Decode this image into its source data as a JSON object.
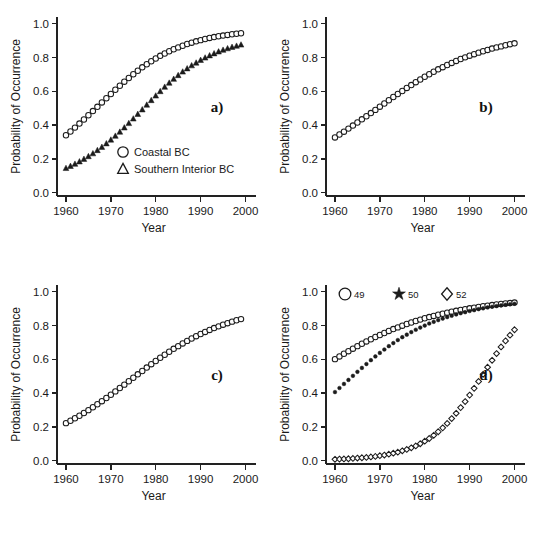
{
  "figure": {
    "name": "probability-of-occurrence-four-panel-figure",
    "background_color": "#ffffff",
    "marker_color": "#1b1b1b",
    "axis_color": "#222222"
  },
  "chart_data": [
    {
      "id": "a",
      "type": "scatter",
      "panel_label": "a)",
      "title": "",
      "xlabel": "Year",
      "ylabel": "Probability of Occurrence",
      "xlim": [
        1958,
        2001
      ],
      "ylim": [
        -0.02,
        1.04
      ],
      "xticks": [
        1960,
        1970,
        1980,
        1990,
        2000
      ],
      "xticklabels": [
        "1960",
        "1970",
        "1980",
        "1990",
        "2000"
      ],
      "yticks": [
        0.0,
        0.2,
        0.4,
        0.6,
        0.8,
        1.0
      ],
      "yticklabels": [
        "0.0",
        "0.2",
        "0.4",
        "0.6",
        "0.8",
        "1.0"
      ],
      "grid": false,
      "legend_position": "lower-center",
      "x": [
        1960,
        1961,
        1962,
        1963,
        1964,
        1965,
        1966,
        1967,
        1968,
        1969,
        1970,
        1971,
        1972,
        1973,
        1974,
        1975,
        1976,
        1977,
        1978,
        1979,
        1980,
        1981,
        1982,
        1983,
        1984,
        1985,
        1986,
        1987,
        1988,
        1989,
        1990,
        1991,
        1992,
        1993,
        1994,
        1995,
        1996,
        1997,
        1998,
        1999
      ],
      "series": [
        {
          "name": "Coastal BC",
          "marker": "circle-open",
          "values": [
            0.34,
            0.362,
            0.385,
            0.409,
            0.433,
            0.458,
            0.483,
            0.508,
            0.534,
            0.559,
            0.584,
            0.609,
            0.633,
            0.657,
            0.679,
            0.701,
            0.722,
            0.742,
            0.76,
            0.778,
            0.794,
            0.81,
            0.824,
            0.837,
            0.849,
            0.86,
            0.87,
            0.88,
            0.888,
            0.896,
            0.903,
            0.91,
            0.916,
            0.921,
            0.926,
            0.93,
            0.934,
            0.938,
            0.941,
            0.944
          ]
        },
        {
          "name": "Southern Interior BC",
          "marker": "triangle-filled",
          "values": [
            0.145,
            0.157,
            0.17,
            0.184,
            0.199,
            0.215,
            0.232,
            0.251,
            0.27,
            0.291,
            0.313,
            0.336,
            0.36,
            0.385,
            0.411,
            0.438,
            0.465,
            0.492,
            0.52,
            0.547,
            0.574,
            0.6,
            0.626,
            0.65,
            0.673,
            0.695,
            0.716,
            0.735,
            0.753,
            0.769,
            0.785,
            0.799,
            0.812,
            0.824,
            0.835,
            0.845,
            0.854,
            0.862,
            0.869,
            0.876
          ]
        }
      ]
    },
    {
      "id": "b",
      "type": "scatter",
      "panel_label": "b)",
      "title": "",
      "xlabel": "Year",
      "ylabel": "Probability of Occurrence",
      "xlim": [
        1958,
        2001
      ],
      "ylim": [
        -0.02,
        1.04
      ],
      "xticks": [
        1960,
        1970,
        1980,
        1990,
        2000
      ],
      "xticklabels": [
        "1960",
        "1970",
        "1980",
        "1990",
        "2000"
      ],
      "yticks": [
        0.0,
        0.2,
        0.4,
        0.6,
        0.8,
        1.0
      ],
      "yticklabels": [
        "0.0",
        "0.2",
        "0.4",
        "0.6",
        "0.8",
        "1.0"
      ],
      "grid": false,
      "legend_position": "none",
      "x": [
        1960,
        1961,
        1962,
        1963,
        1964,
        1965,
        1966,
        1967,
        1968,
        1969,
        1970,
        1971,
        1972,
        1973,
        1974,
        1975,
        1976,
        1977,
        1978,
        1979,
        1980,
        1981,
        1982,
        1983,
        1984,
        1985,
        1986,
        1987,
        1988,
        1989,
        1990,
        1991,
        1992,
        1993,
        1994,
        1995,
        1996,
        1997,
        1998,
        1999,
        2000
      ],
      "series": [
        {
          "name": "series-b",
          "marker": "circle-open",
          "values": [
            0.327,
            0.344,
            0.361,
            0.379,
            0.397,
            0.415,
            0.434,
            0.452,
            0.471,
            0.49,
            0.509,
            0.528,
            0.547,
            0.566,
            0.584,
            0.602,
            0.62,
            0.637,
            0.654,
            0.67,
            0.686,
            0.701,
            0.716,
            0.73,
            0.743,
            0.756,
            0.768,
            0.78,
            0.791,
            0.801,
            0.811,
            0.82,
            0.829,
            0.837,
            0.845,
            0.853,
            0.86,
            0.866,
            0.873,
            0.879,
            0.884
          ]
        }
      ]
    },
    {
      "id": "c",
      "type": "scatter",
      "panel_label": "c)",
      "title": "",
      "xlabel": "Year",
      "ylabel": "Probability of Occurrence",
      "xlim": [
        1958,
        2001
      ],
      "ylim": [
        -0.02,
        1.04
      ],
      "xticks": [
        1960,
        1970,
        1980,
        1990,
        2000
      ],
      "xticklabels": [
        "1960",
        "1970",
        "1980",
        "1990",
        "2000"
      ],
      "yticks": [
        0.0,
        0.2,
        0.4,
        0.6,
        0.8,
        1.0
      ],
      "yticklabels": [
        "0.0",
        "0.2",
        "0.4",
        "0.6",
        "0.8",
        "1.0"
      ],
      "grid": false,
      "legend_position": "none",
      "x": [
        1960,
        1961,
        1962,
        1963,
        1964,
        1965,
        1966,
        1967,
        1968,
        1969,
        1970,
        1971,
        1972,
        1973,
        1974,
        1975,
        1976,
        1977,
        1978,
        1979,
        1980,
        1981,
        1982,
        1983,
        1984,
        1985,
        1986,
        1987,
        1988,
        1989,
        1990,
        1991,
        1992,
        1993,
        1994,
        1995,
        1996,
        1997,
        1998,
        1999
      ],
      "series": [
        {
          "name": "series-c",
          "marker": "circle-open",
          "values": [
            0.222,
            0.236,
            0.251,
            0.266,
            0.282,
            0.299,
            0.316,
            0.334,
            0.352,
            0.371,
            0.39,
            0.41,
            0.43,
            0.45,
            0.47,
            0.491,
            0.511,
            0.531,
            0.551,
            0.571,
            0.59,
            0.609,
            0.627,
            0.645,
            0.662,
            0.678,
            0.694,
            0.709,
            0.723,
            0.737,
            0.75,
            0.762,
            0.774,
            0.785,
            0.795,
            0.805,
            0.814,
            0.823,
            0.831,
            0.838
          ]
        }
      ]
    },
    {
      "id": "d",
      "type": "scatter",
      "panel_label": "d)",
      "title": "",
      "xlabel": "Year",
      "ylabel": "Probability of Occurrence",
      "xlim": [
        1958,
        2001
      ],
      "ylim": [
        -0.02,
        1.04
      ],
      "xticks": [
        1960,
        1970,
        1980,
        1990,
        2000
      ],
      "xticklabels": [
        "1960",
        "1970",
        "1980",
        "1990",
        "2000"
      ],
      "yticks": [
        0.0,
        0.2,
        0.4,
        0.6,
        0.8,
        1.0
      ],
      "yticklabels": [
        "0.0",
        "0.2",
        "0.4",
        "0.6",
        "0.8",
        "1.0"
      ],
      "grid": false,
      "legend_position": "top-left",
      "x": [
        1960,
        1961,
        1962,
        1963,
        1964,
        1965,
        1966,
        1967,
        1968,
        1969,
        1970,
        1971,
        1972,
        1973,
        1974,
        1975,
        1976,
        1977,
        1978,
        1979,
        1980,
        1981,
        1982,
        1983,
        1984,
        1985,
        1986,
        1987,
        1988,
        1989,
        1990,
        1991,
        1992,
        1993,
        1994,
        1995,
        1996,
        1997,
        1998,
        1999,
        2000
      ],
      "series": [
        {
          "name": "49",
          "marker": "circle-open",
          "values": [
            0.601,
            0.617,
            0.633,
            0.648,
            0.663,
            0.678,
            0.692,
            0.706,
            0.719,
            0.732,
            0.744,
            0.756,
            0.768,
            0.779,
            0.789,
            0.799,
            0.809,
            0.818,
            0.827,
            0.835,
            0.843,
            0.85,
            0.857,
            0.864,
            0.87,
            0.876,
            0.882,
            0.887,
            0.892,
            0.897,
            0.902,
            0.906,
            0.91,
            0.914,
            0.918,
            0.921,
            0.925,
            0.928,
            0.931,
            0.933,
            0.936
          ]
        },
        {
          "name": "50",
          "marker": "star-filled",
          "values": [
            0.406,
            0.43,
            0.454,
            0.478,
            0.502,
            0.526,
            0.549,
            0.572,
            0.595,
            0.617,
            0.638,
            0.658,
            0.678,
            0.696,
            0.714,
            0.731,
            0.746,
            0.761,
            0.775,
            0.788,
            0.8,
            0.812,
            0.822,
            0.832,
            0.841,
            0.85,
            0.858,
            0.866,
            0.873,
            0.879,
            0.886,
            0.891,
            0.897,
            0.902,
            0.907,
            0.911,
            0.915,
            0.919,
            0.923,
            0.926,
            0.929
          ]
        },
        {
          "name": "52",
          "marker": "diamond-open",
          "values": [
            0.008,
            0.009,
            0.01,
            0.011,
            0.013,
            0.015,
            0.017,
            0.019,
            0.022,
            0.025,
            0.029,
            0.033,
            0.038,
            0.044,
            0.05,
            0.058,
            0.066,
            0.076,
            0.087,
            0.1,
            0.115,
            0.131,
            0.15,
            0.171,
            0.194,
            0.22,
            0.249,
            0.28,
            0.314,
            0.35,
            0.388,
            0.428,
            0.469,
            0.511,
            0.553,
            0.594,
            0.634,
            0.673,
            0.709,
            0.743,
            0.775
          ]
        }
      ]
    }
  ],
  "legends": {
    "panel_a": {
      "entries": [
        {
          "marker": "circle-open",
          "label": "Coastal BC"
        },
        {
          "marker": "triangle-open",
          "label": "Southern Interior BC"
        }
      ]
    },
    "panel_d": {
      "entries": [
        {
          "marker": "circle-open",
          "label": "49"
        },
        {
          "marker": "star-filled",
          "label": "50"
        },
        {
          "marker": "diamond-open",
          "label": "52"
        }
      ]
    }
  }
}
